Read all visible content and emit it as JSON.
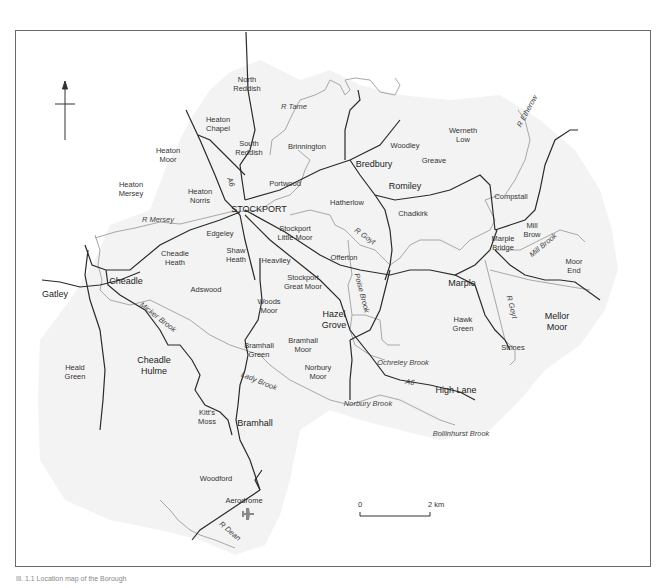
{
  "map": {
    "caption": "Ill. 1.1 Location map of the Borough",
    "north_arrow": "north-arrow",
    "scale_bar": {
      "start_label": "0",
      "end_label": "2 km"
    },
    "colors": {
      "road": "#2a2a2a",
      "river": "#a8a8a8",
      "land": "#f3f3f3",
      "frame": "#6a6a6a"
    },
    "places": [
      {
        "name": "North\nReddish",
        "x": 247,
        "y": 84
      },
      {
        "name": "Heaton\nChapel",
        "x": 218,
        "y": 124
      },
      {
        "name": "South\nReddish",
        "x": 249,
        "y": 148
      },
      {
        "name": "Brinnington",
        "x": 307,
        "y": 146
      },
      {
        "name": "Heaton\nMoor",
        "x": 168,
        "y": 155
      },
      {
        "name": "Heaton\nMersey",
        "x": 131,
        "y": 189
      },
      {
        "name": "Heaton\nNorris",
        "x": 200,
        "y": 196
      },
      {
        "name": "Portwood",
        "x": 285,
        "y": 183
      },
      {
        "name": "STOCKPORT",
        "x": 259,
        "y": 209,
        "big": true
      },
      {
        "name": "Edgeley",
        "x": 220,
        "y": 233
      },
      {
        "name": "Stockport\nLittle Moor",
        "x": 295,
        "y": 233
      },
      {
        "name": "Shaw\nHeath",
        "x": 236,
        "y": 255
      },
      {
        "name": "Heaviley",
        "x": 276,
        "y": 260
      },
      {
        "name": "Cheadle\nHeath",
        "x": 175,
        "y": 258
      },
      {
        "name": "Cheadle",
        "x": 126,
        "y": 281,
        "big": true
      },
      {
        "name": "Gatley",
        "x": 55,
        "y": 294,
        "big": true
      },
      {
        "name": "Adswood",
        "x": 206,
        "y": 289
      },
      {
        "name": "Stockport\nGreat Moor",
        "x": 303,
        "y": 282
      },
      {
        "name": "Woods\nMoor",
        "x": 269,
        "y": 306
      },
      {
        "name": "Hazel\nGrove",
        "x": 334,
        "y": 320,
        "big": true
      },
      {
        "name": "Bramhall\nGreen",
        "x": 259,
        "y": 350
      },
      {
        "name": "Bramhall\nMoor",
        "x": 303,
        "y": 345
      },
      {
        "name": "Norbury\nMoor",
        "x": 318,
        "y": 372
      },
      {
        "name": "Heald\nGreen",
        "x": 75,
        "y": 372
      },
      {
        "name": "Cheadle\nHulme",
        "x": 154,
        "y": 366,
        "big": true
      },
      {
        "name": "Kitt's\nMoss",
        "x": 207,
        "y": 417
      },
      {
        "name": "Bramhall",
        "x": 255,
        "y": 423,
        "big": true
      },
      {
        "name": "Woodford",
        "x": 216,
        "y": 478
      },
      {
        "name": "Aerodrome",
        "x": 244,
        "y": 500
      },
      {
        "name": "Bredbury",
        "x": 374,
        "y": 164,
        "big": true
      },
      {
        "name": "Woodley",
        "x": 405,
        "y": 145
      },
      {
        "name": "Werneth\nLow",
        "x": 463,
        "y": 135
      },
      {
        "name": "Greave",
        "x": 434,
        "y": 160
      },
      {
        "name": "Romiley",
        "x": 405,
        "y": 186,
        "big": true
      },
      {
        "name": "Hatherlow",
        "x": 347,
        "y": 202
      },
      {
        "name": "Chadkirk",
        "x": 413,
        "y": 213
      },
      {
        "name": "Compstall",
        "x": 511,
        "y": 196
      },
      {
        "name": "Offerton",
        "x": 344,
        "y": 257
      },
      {
        "name": "Mill\nBrow",
        "x": 532,
        "y": 230
      },
      {
        "name": "Marple\nBridge",
        "x": 503,
        "y": 243
      },
      {
        "name": "Moor\nEnd",
        "x": 574,
        "y": 266
      },
      {
        "name": "Marple",
        "x": 462,
        "y": 283,
        "big": true
      },
      {
        "name": "Hawk\nGreen",
        "x": 463,
        "y": 324
      },
      {
        "name": "Mellor\nMoor",
        "x": 557,
        "y": 322,
        "big": true
      },
      {
        "name": "Strines",
        "x": 513,
        "y": 347
      },
      {
        "name": "High Lane",
        "x": 456,
        "y": 390,
        "big": true
      }
    ],
    "rivers": [
      {
        "name": "R Tame",
        "x": 294,
        "y": 106,
        "rot": 0
      },
      {
        "name": "R Mersey",
        "x": 158,
        "y": 219,
        "rot": 0
      },
      {
        "name": "R Goyt",
        "x": 365,
        "y": 236,
        "rot": 35
      },
      {
        "name": "Poise Brook",
        "x": 362,
        "y": 293,
        "rot": 75
      },
      {
        "name": "R Etherow",
        "x": 527,
        "y": 111,
        "rot": -62
      },
      {
        "name": "Mill Brook",
        "x": 543,
        "y": 245,
        "rot": -40
      },
      {
        "name": "R Goyt",
        "x": 512,
        "y": 307,
        "rot": 75
      },
      {
        "name": "Ochreley Brook",
        "x": 403,
        "y": 362,
        "rot": 0
      },
      {
        "name": "Micker Brook",
        "x": 158,
        "y": 317,
        "rot": 38
      },
      {
        "name": "Lady Brook",
        "x": 259,
        "y": 381,
        "rot": 22
      },
      {
        "name": "Norbury Brook",
        "x": 368,
        "y": 403,
        "rot": 0
      },
      {
        "name": "Bollinhurst Brook",
        "x": 461,
        "y": 433,
        "rot": 0
      },
      {
        "name": "R Dean",
        "x": 230,
        "y": 531,
        "rot": 40
      }
    ],
    "roads": [
      {
        "name": "A6",
        "x": 231,
        "y": 182,
        "rot": 70
      },
      {
        "name": "A6",
        "x": 410,
        "y": 382,
        "rot": 10
      }
    ]
  }
}
